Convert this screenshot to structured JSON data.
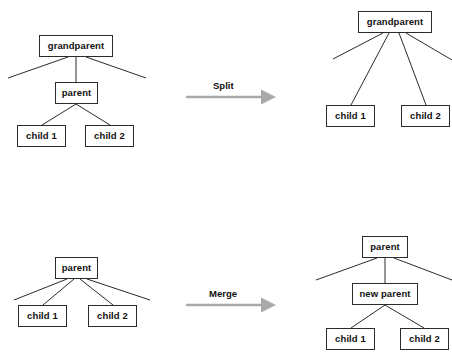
{
  "diagram": {
    "colors": {
      "node_border": "#2b2b2b",
      "node_fill": "#ffffff",
      "edge": "#2b2b2b",
      "arrow": "#a9a9a9",
      "text": "#111111",
      "background": "#ffffff"
    },
    "operations": [
      {
        "name": "split",
        "label": "Split",
        "before": {
          "nodes": [
            {
              "id": "tl-grandparent",
              "label": "grandparent",
              "x": 39,
              "y": 35,
              "w": 74,
              "h": 22
            },
            {
              "id": "tl-parent",
              "label": "parent",
              "x": 55,
              "y": 82,
              "w": 43,
              "h": 22
            },
            {
              "id": "tl-child1",
              "label": "child 1",
              "x": 17,
              "y": 125,
              "w": 49,
              "h": 22
            },
            {
              "id": "tl-child2",
              "label": "child 2",
              "x": 85,
              "y": 125,
              "w": 49,
              "h": 22
            }
          ],
          "edges": [
            {
              "from": "tl-grandparent",
              "to": "stub-left",
              "x1": 68,
              "y1": 57,
              "x2": 8,
              "y2": 78
            },
            {
              "from": "tl-grandparent",
              "to": "tl-parent",
              "x1": 76,
              "y1": 57,
              "x2": 76,
              "y2": 82
            },
            {
              "from": "tl-grandparent",
              "to": "stub-right",
              "x1": 86,
              "y1": 57,
              "x2": 146,
              "y2": 78
            },
            {
              "from": "tl-parent",
              "to": "tl-child1",
              "x1": 76,
              "y1": 104,
              "x2": 42,
              "y2": 125
            },
            {
              "from": "tl-parent",
              "to": "tl-child2",
              "x1": 76,
              "y1": 104,
              "x2": 110,
              "y2": 125
            }
          ]
        },
        "after": {
          "nodes": [
            {
              "id": "tr-grandparent",
              "label": "grandparent",
              "x": 358,
              "y": 11,
              "w": 74,
              "h": 22
            },
            {
              "id": "tr-child1",
              "label": "child 1",
              "x": 326,
              "y": 105,
              "w": 49,
              "h": 22
            },
            {
              "id": "tr-child2",
              "label": "child 2",
              "x": 401,
              "y": 105,
              "w": 49,
              "h": 22
            }
          ],
          "edges": [
            {
              "from": "tr-grandparent",
              "to": "stub-left",
              "x1": 383,
              "y1": 33,
              "x2": 333,
              "y2": 59
            },
            {
              "from": "tr-grandparent",
              "to": "tr-child1",
              "x1": 389,
              "y1": 33,
              "x2": 351,
              "y2": 105
            },
            {
              "from": "tr-grandparent",
              "to": "tr-child2",
              "x1": 399,
              "y1": 33,
              "x2": 426,
              "y2": 105
            },
            {
              "from": "tr-grandparent",
              "to": "stub-right",
              "x1": 406,
              "y1": 33,
              "x2": 452,
              "y2": 60
            }
          ]
        },
        "arrow": {
          "x1": 186,
          "y1": 97,
          "x2": 276,
          "y2": 97,
          "label_x": 213,
          "label_y": 80
        }
      },
      {
        "name": "merge",
        "label": "Merge",
        "before": {
          "nodes": [
            {
              "id": "bl-parent",
              "label": "parent",
              "x": 55,
              "y": 257,
              "w": 43,
              "h": 22
            },
            {
              "id": "bl-child1",
              "label": "child 1",
              "x": 18,
              "y": 305,
              "w": 49,
              "h": 22
            },
            {
              "id": "bl-child2",
              "label": "child 2",
              "x": 88,
              "y": 305,
              "w": 49,
              "h": 22
            }
          ],
          "edges": [
            {
              "from": "bl-parent",
              "to": "stub-left",
              "x1": 67,
              "y1": 279,
              "x2": 14,
              "y2": 300
            },
            {
              "from": "bl-parent",
              "to": "bl-child1",
              "x1": 74,
              "y1": 279,
              "x2": 43,
              "y2": 305
            },
            {
              "from": "bl-parent",
              "to": "bl-child2",
              "x1": 80,
              "y1": 279,
              "x2": 113,
              "y2": 305
            },
            {
              "from": "bl-parent",
              "to": "stub-right",
              "x1": 87,
              "y1": 279,
              "x2": 150,
              "y2": 300
            }
          ]
        },
        "after": {
          "nodes": [
            {
              "id": "br-parent",
              "label": "parent",
              "x": 362,
              "y": 236,
              "w": 46,
              "h": 22
            },
            {
              "id": "br-newparent",
              "label": "new parent",
              "x": 352,
              "y": 283,
              "w": 66,
              "h": 22
            },
            {
              "id": "br-child1",
              "label": "child 1",
              "x": 326,
              "y": 328,
              "w": 49,
              "h": 22
            },
            {
              "id": "br-child2",
              "label": "child 2",
              "x": 400,
              "y": 328,
              "w": 49,
              "h": 22
            }
          ],
          "edges": [
            {
              "from": "br-parent",
              "to": "stub-left",
              "x1": 377,
              "y1": 258,
              "x2": 316,
              "y2": 280
            },
            {
              "from": "br-parent",
              "to": "br-newparent",
              "x1": 385,
              "y1": 258,
              "x2": 385,
              "y2": 283
            },
            {
              "from": "br-parent",
              "to": "stub-right",
              "x1": 394,
              "y1": 258,
              "x2": 452,
              "y2": 280
            },
            {
              "from": "br-newparent",
              "to": "br-child1",
              "x1": 385,
              "y1": 305,
              "x2": 351,
              "y2": 328
            },
            {
              "from": "br-newparent",
              "to": "br-child2",
              "x1": 385,
              "y1": 305,
              "x2": 424,
              "y2": 328
            }
          ]
        },
        "arrow": {
          "x1": 186,
          "y1": 305,
          "x2": 276,
          "y2": 305,
          "label_x": 209,
          "label_y": 288
        }
      }
    ]
  }
}
